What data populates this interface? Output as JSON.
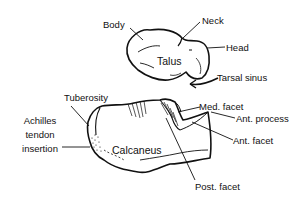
{
  "diagram": {
    "bones": {
      "talus": "Talus",
      "calcaneus": "Calcaneus"
    },
    "labels": {
      "body": "Body",
      "neck": "Neck",
      "head": "Head",
      "tarsal_sinus": "Tarsal sinus",
      "tuberosity": "Tuberosity",
      "achilles_line1": "Achilles",
      "achilles_line2": "tendon",
      "achilles_line3": "insertion",
      "med_facet": "Med. facet",
      "ant_process": "Ant. process",
      "ant_facet": "Ant. facet",
      "post_facet": "Post. facet"
    },
    "colors": {
      "line": "#111111",
      "background": "#ffffff"
    }
  }
}
